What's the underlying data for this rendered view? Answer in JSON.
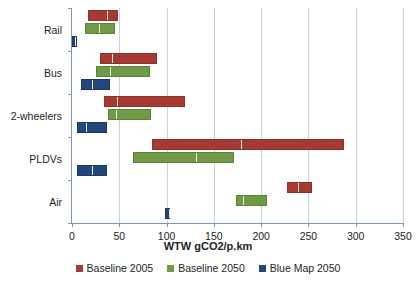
{
  "chart_data": {
    "type": "bar",
    "subtype": "floating-range-bar",
    "title": "",
    "xlabel": "WTW gCO2/p.km",
    "ylabel": "",
    "xlim": [
      0,
      350
    ],
    "xticks": [
      0,
      50,
      100,
      150,
      200,
      250,
      300,
      350
    ],
    "xtick_labels": [
      "0",
      "50",
      "100",
      "150",
      "200",
      "250",
      "300",
      "350"
    ],
    "grid": "vertical",
    "legend_position": "bottom",
    "categories": [
      "Rail",
      "Bus",
      "2-wheelers",
      "PLDVs",
      "Air"
    ],
    "series": [
      {
        "name": "Baseline 2005",
        "color": "#a53a32",
        "ranges": [
          {
            "category": "Rail",
            "low": 17,
            "high": 49,
            "marker": 36
          },
          {
            "category": "Bus",
            "low": 30,
            "high": 90,
            "marker": 41
          },
          {
            "category": "2-wheelers",
            "low": 34,
            "high": 120,
            "marker": 47
          },
          {
            "category": "PLDVs",
            "low": 85,
            "high": 288,
            "marker": 178
          },
          {
            "category": "Air",
            "low": 227,
            "high": 254,
            "marker": 238
          }
        ]
      },
      {
        "name": "Baseline 2050",
        "color": "#6f9a46",
        "ranges": [
          {
            "category": "Rail",
            "low": 14,
            "high": 45,
            "marker": 27
          },
          {
            "category": "Bus",
            "low": 25,
            "high": 82,
            "marker": 39
          },
          {
            "category": "2-wheelers",
            "low": 38,
            "high": 84,
            "marker": 45
          },
          {
            "category": "PLDVs",
            "low": 65,
            "high": 171,
            "marker": 130
          },
          {
            "category": "Air",
            "low": 173,
            "high": 206,
            "marker": 180
          }
        ]
      },
      {
        "name": "Blue Map 2050",
        "color": "#22477a",
        "ranges": [
          {
            "category": "Rail",
            "low": 0,
            "high": 5,
            "marker": 2
          },
          {
            "category": "Bus",
            "low": 10,
            "high": 40,
            "marker": 20
          },
          {
            "category": "2-wheelers",
            "low": 5,
            "high": 37,
            "marker": 14
          },
          {
            "category": "PLDVs",
            "low": 5,
            "high": 37,
            "marker": 20
          },
          {
            "category": "Air",
            "low": 98,
            "high": 104,
            "marker": 101
          }
        ]
      }
    ]
  },
  "axis": {
    "xlabel": "WTW gCO2/p.km"
  },
  "legend": {
    "items": [
      {
        "label": "Baseline 2005"
      },
      {
        "label": "Baseline 2050"
      },
      {
        "label": "Blue Map 2050"
      }
    ]
  }
}
